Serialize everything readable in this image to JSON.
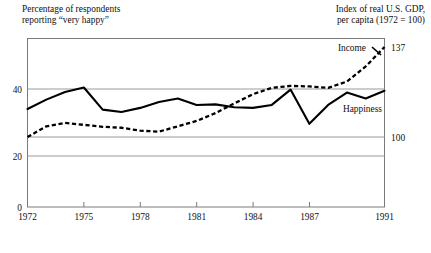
{
  "chart_data": {
    "type": "line",
    "title": "",
    "left_caption": "Percentage of respondents\nreporting “very happy”",
    "right_caption": "Index of real U.S. GDP,\nper capita (1972 = 100)",
    "xlabel": "",
    "ylabel_left": "Percentage of respondents reporting “very happy”",
    "ylabel_right": "Index of real U.S. GDP, per capita (1972 = 100)",
    "x": [
      1972,
      1973,
      1974,
      1975,
      1976,
      1977,
      1978,
      1979,
      1980,
      1981,
      1982,
      1983,
      1984,
      1985,
      1986,
      1987,
      1988,
      1989,
      1990,
      1991
    ],
    "xticks": [
      "1972",
      "1975",
      "1978",
      "1981",
      "1984",
      "1987",
      "1991"
    ],
    "xtick_values": [
      1972,
      1975,
      1978,
      1981,
      1984,
      1987,
      1991
    ],
    "xlim": [
      1972,
      1991
    ],
    "yticks_left": [
      "0",
      "20",
      "40"
    ],
    "ytick_values_left": [
      0,
      20,
      40
    ],
    "ylim_left": [
      0,
      48
    ],
    "yticks_right": [
      "100",
      "137"
    ],
    "ytick_values_right": [
      100,
      137
    ],
    "grid": true,
    "gridlines_left": [
      20,
      40
    ],
    "legend_position": "inline-annotation",
    "series": [
      {
        "name": "Happiness",
        "axis": "left",
        "style": "solid",
        "color": "#000000",
        "label_annotation": "Happiness",
        "values": [
          33.2,
          36.4,
          39.0,
          40.5,
          33.0,
          32.2,
          33.6,
          35.6,
          36.8,
          34.6,
          34.8,
          33.8,
          33.6,
          34.6,
          39.8,
          28.2,
          34.6,
          38.8,
          36.8,
          39.4
        ]
      },
      {
        "name": "Income",
        "axis": "right",
        "style": "dashed",
        "color": "#000000",
        "label_annotation": "Income",
        "values": [
          100.0,
          104.4,
          105.8,
          105.0,
          104.2,
          103.8,
          102.6,
          102.2,
          104.4,
          106.6,
          109.8,
          113.8,
          117.6,
          120.2,
          121.0,
          120.8,
          120.2,
          122.8,
          129.0,
          137.0
        ]
      }
    ],
    "annotations": [
      {
        "text": "Income",
        "x": 1988.6,
        "y_right": 132.0
      },
      {
        "text": "Happiness",
        "x": 1988.0,
        "y_left": 32.6
      },
      {
        "text": "137",
        "x": 1991,
        "y_right": 137
      },
      {
        "text": "100",
        "x": 1991,
        "y_right": 100
      }
    ]
  },
  "axes": {
    "left_ticks": [
      "0",
      "20",
      "40"
    ],
    "right_ticks": [
      "137",
      "100"
    ],
    "bottom_ticks": [
      "1972",
      "1975",
      "1978",
      "1981",
      "1984",
      "1987",
      "1991"
    ]
  },
  "labels": {
    "income": "Income",
    "happiness": "Happiness",
    "value_137": "137",
    "value_100": "100",
    "tick_0": "0",
    "tick_20": "20",
    "tick_40": "40",
    "year_1972": "1972",
    "year_1975": "1975",
    "year_1978": "1978",
    "year_1981": "1981",
    "year_1984": "1984",
    "year_1987": "1987",
    "year_1991": "1991"
  },
  "captions": {
    "left": "Percentage of respondents\nreporting “very happy”",
    "right": "Index of real U.S. GDP,\nper capita (1972 = 100)"
  },
  "colors": {
    "ink": "#000000",
    "frame": "#7a7a7a",
    "grid": "#9a9a9a",
    "background": "#ffffff"
  }
}
